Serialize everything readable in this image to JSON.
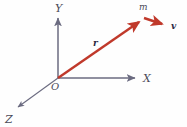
{
  "figure": {
    "kind": "vector-diagram",
    "background_color": "#fefefe",
    "axis_color": "#6b6b80",
    "vector_color": "#c0392b",
    "label_color": "#4a4a58",
    "vector_label_color": "#2a2a44"
  },
  "axes": {
    "x": {
      "label": "X",
      "label_x": 143,
      "label_y": 80,
      "from_x": 58,
      "from_y": 78,
      "to_x": 136,
      "to_y": 78
    },
    "y": {
      "label": "Y",
      "label_x": 55,
      "label_y": 12,
      "from_x": 58,
      "from_y": 78,
      "to_x": 58,
      "to_y": 18
    },
    "z": {
      "label": "Z",
      "label_x": 5,
      "label_y": 122,
      "from_x": 58,
      "from_y": 78,
      "to_x": 16,
      "to_y": 108
    }
  },
  "origin": {
    "label": "O",
    "label_x": 52,
    "label_y": 90
  },
  "vectors": [
    {
      "name": "position-vector",
      "label": "r",
      "label_x": 93,
      "label_y": 45,
      "from_x": 58,
      "from_y": 78,
      "to_x": 143,
      "to_y": 19,
      "color": "#c0392b"
    },
    {
      "name": "velocity-vector",
      "label": "v",
      "label_x": 172,
      "label_y": 29,
      "from_x": 144,
      "from_y": 18,
      "to_x": 166,
      "to_y": 25,
      "color": "#c0392b"
    }
  ],
  "points": [
    {
      "name": "particle",
      "label": "m",
      "label_x": 140,
      "label_y": 10,
      "x": 143,
      "y": 19
    }
  ]
}
